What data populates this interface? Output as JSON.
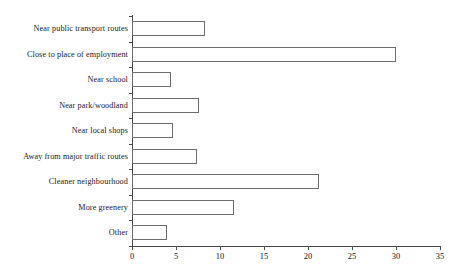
{
  "chart_data": {
    "type": "bar",
    "orientation": "horizontal",
    "title": "",
    "subtitle": "",
    "xlabel": "",
    "ylabel": "",
    "xlim": [
      0,
      35
    ],
    "ylim": null,
    "grid": false,
    "legend": null,
    "xticks": [
      "0",
      "5",
      "10",
      "15",
      "20",
      "25",
      "30",
      "35"
    ],
    "xtick_values": [
      0,
      5,
      10,
      15,
      20,
      25,
      30,
      35
    ],
    "categories": [
      "Near public transport routes",
      "Close to place of employment",
      "Near school",
      "Near park/woodland",
      "Near local shops",
      "Away from major traffic routes",
      "Cleaner neighbourhood",
      "More greenery",
      "Other"
    ],
    "values": [
      8.3,
      30,
      4.4,
      7.6,
      4.7,
      7.4,
      21.2,
      11.6,
      4
    ],
    "bar_fill_color": "#ffffff",
    "bar_edge_color": "#6d6d6d",
    "axis_color": "#4a4a4a",
    "background_color": "#ffffff"
  }
}
